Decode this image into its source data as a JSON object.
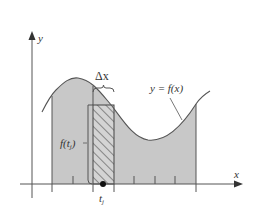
{
  "diagram": {
    "colors": {
      "background": "#ffffff",
      "shade": "#c8c8c8",
      "stroke": "#555555",
      "text": "#333333",
      "hatch": "#444444"
    },
    "labels": {
      "y_axis": "y",
      "x_axis": "x",
      "curve": "y = f(x)",
      "delta_x": "Δx",
      "f_tj_main": "f(t",
      "f_tj_sub": "j",
      "f_tj_close": ")",
      "tj_main": "t",
      "tj_sub": "j"
    },
    "ticks_x": [
      52,
      73,
      93,
      114,
      134,
      155,
      175,
      196
    ],
    "region": {
      "x_start": 52,
      "x_end": 196
    },
    "strip": {
      "x_left": 93,
      "x_right": 114,
      "top": 105
    },
    "sample_point": {
      "x": 103,
      "y": 184
    }
  }
}
